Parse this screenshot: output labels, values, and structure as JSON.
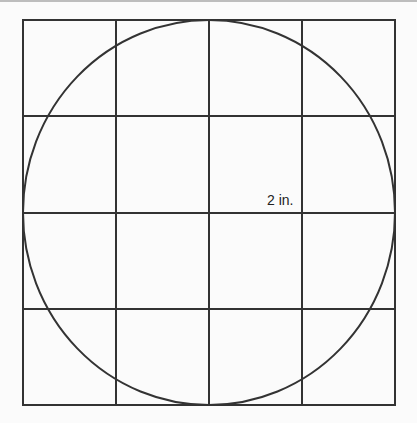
{
  "figure": {
    "label": "2 in.",
    "grid": {
      "cols": 4,
      "rows": 4,
      "x0": 23,
      "y0": 20,
      "x1": 395,
      "y1": 405
    },
    "circle": {
      "cx": 209,
      "cy": 212.5,
      "rx": 186,
      "ry": 192.5
    },
    "colors": {
      "line": "#333333",
      "background": "#fbfbfb"
    }
  }
}
